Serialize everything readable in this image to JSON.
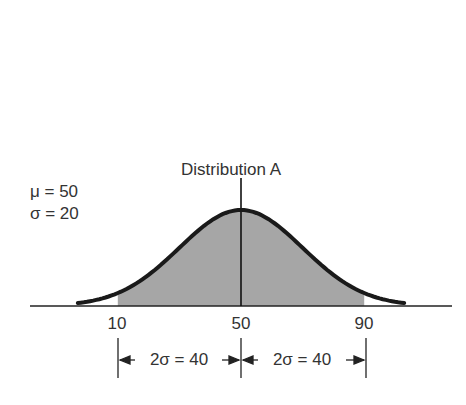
{
  "chart_data": {
    "type": "area",
    "title": "Distribution A",
    "distribution": "normal",
    "parameters": {
      "mu": 50,
      "sigma": 20
    },
    "parameter_labels": [
      "μ = 50",
      "σ = 20"
    ],
    "x_ticks": [
      10,
      50,
      90
    ],
    "x_tick_labels": [
      "10",
      "50",
      "90"
    ],
    "shaded_region": {
      "from": 10,
      "to": 90,
      "color": "#a6a6a6"
    },
    "mean_line": 50,
    "dimension_annotations": [
      {
        "from": 10,
        "to": 50,
        "label": "2σ = 40"
      },
      {
        "from": 50,
        "to": 90,
        "label": "2σ = 40"
      }
    ],
    "xlim": [
      -15,
      120
    ],
    "xlabel": "",
    "ylabel": "",
    "grid": false,
    "curve_color": "#1a1a1a"
  },
  "labels": {
    "title": "Distribution A",
    "mu": "μ = 50",
    "sigma": "σ = 20",
    "tick_10": "10",
    "tick_50": "50",
    "tick_90": "90",
    "dim_left": "2σ = 40",
    "dim_right": "2σ = 40"
  }
}
